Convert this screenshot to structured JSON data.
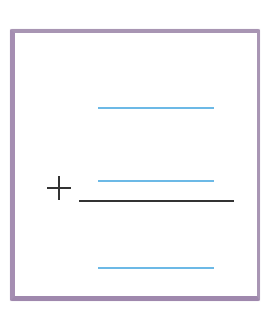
{
  "worksheet": {
    "type": "vertical-addition-blank",
    "operator": "+",
    "operator_label": "plus",
    "colors": {
      "border": "#a58eb2",
      "answer_blank": "#6cb9e6",
      "ink": "#333333",
      "background": "#ffffff"
    },
    "blanks": [
      {
        "role": "first-addend",
        "value": ""
      },
      {
        "role": "second-addend",
        "value": ""
      },
      {
        "role": "sum",
        "value": ""
      }
    ]
  }
}
